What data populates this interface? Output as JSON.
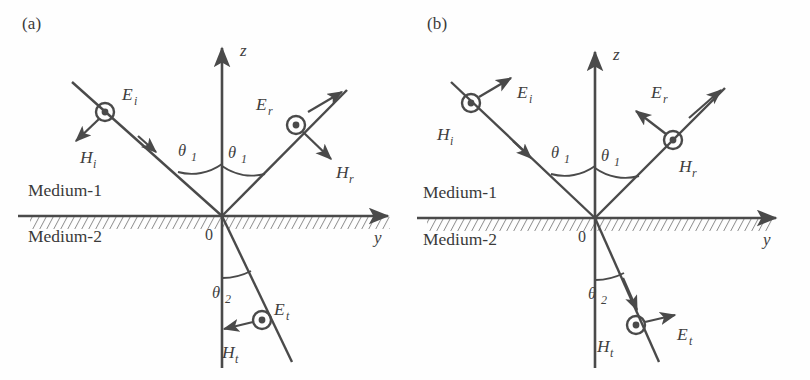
{
  "figure": {
    "type": "physics-diagram",
    "stroke_color": "#4a4a4a",
    "text_color": "#3a3a3a",
    "background": "#ffffff"
  },
  "panels": [
    {
      "id": "a",
      "label": "(a)",
      "polarization": "perpendicular",
      "origin": {
        "x": 222,
        "y": 216
      },
      "axes": {
        "z": {
          "label": "z",
          "x": 222,
          "y_top": 44,
          "y_bottom": 368
        },
        "y": {
          "label": "y",
          "x_left": 18,
          "x_right": 392,
          "y": 216
        }
      },
      "origin_label": "0",
      "media": [
        {
          "name": "Medium-1",
          "x": 28,
          "y": 190
        },
        {
          "name": "Medium-2",
          "x": 28,
          "y": 233
        }
      ],
      "angles": [
        {
          "label": "θ",
          "sub": "1",
          "x": 185,
          "y": 158,
          "arc": "incident"
        },
        {
          "label": "θ",
          "sub": "1",
          "x": 232,
          "y": 160,
          "arc": "reflected"
        },
        {
          "label": "θ",
          "sub": "2",
          "x": 215,
          "y": 292,
          "arc": "transmitted"
        }
      ],
      "rays": [
        {
          "name": "incident",
          "from": {
            "x": 72,
            "y": 82
          },
          "to": {
            "x": 222,
            "y": 216
          },
          "arrow_at": {
            "x": 150,
            "y": 147
          },
          "node": {
            "x": 105,
            "y": 112,
            "kind": "circle-dot"
          },
          "node_field": "E",
          "node_sub": "i",
          "node_label_pos": {
            "x": 122,
            "y": 104
          },
          "arrow_field": "H",
          "arrow_sub": "i",
          "arrow_from": {
            "x": 105,
            "y": 112
          },
          "arrow_to": {
            "x": 76,
            "y": 141
          },
          "arrow_label_pos": {
            "x": 82,
            "y": 166
          }
        },
        {
          "name": "reflected",
          "from": {
            "x": 222,
            "y": 216
          },
          "to": {
            "x": 345,
            "y": 92
          },
          "node": {
            "x": 296,
            "y": 125,
            "kind": "circle-dot"
          },
          "node_field": "E",
          "node_sub": "r",
          "node_label_pos": {
            "x": 258,
            "y": 110
          },
          "arrow_field": "H",
          "arrow_sub": "r",
          "arrow_from": {
            "x": 296,
            "y": 125
          },
          "arrow_to": {
            "x": 330,
            "y": 158
          },
          "arrow_label_pos": {
            "x": 336,
            "y": 178
          }
        },
        {
          "name": "transmitted",
          "from": {
            "x": 222,
            "y": 216
          },
          "to": {
            "x": 290,
            "y": 360
          },
          "node": {
            "x": 262,
            "y": 320,
            "kind": "circle-dot"
          },
          "node_field": "E",
          "node_sub": "t",
          "node_label_pos": {
            "x": 276,
            "y": 316
          },
          "arrow_field": "H",
          "arrow_sub": "t",
          "arrow_from": {
            "x": 262,
            "y": 320
          },
          "arrow_to": {
            "x": 224,
            "y": 330
          },
          "arrow_label_pos": {
            "x": 224,
            "y": 358
          }
        }
      ]
    },
    {
      "id": "b",
      "label": "(b)",
      "polarization": "parallel",
      "origin": {
        "x": 190,
        "y": 218
      },
      "axes": {
        "z": {
          "label": "z",
          "x": 190,
          "y_top": 48,
          "y_bottom": 368
        },
        "y": {
          "label": "y",
          "x_left": 12,
          "x_right": 375,
          "y": 218
        }
      },
      "origin_label": "0",
      "media": [
        {
          "name": "Medium-1",
          "x": 18,
          "y": 192
        },
        {
          "name": "Medium-2",
          "x": 18,
          "y": 236
        }
      ],
      "angles": [
        {
          "label": "θ",
          "sub": "1",
          "x": 152,
          "y": 160,
          "arc": "incident"
        },
        {
          "label": "θ",
          "sub": "1",
          "x": 200,
          "y": 163,
          "arc": "reflected"
        },
        {
          "label": "θ",
          "sub": "2",
          "x": 186,
          "y": 293,
          "arc": "transmitted"
        }
      ],
      "rays": [
        {
          "name": "incident",
          "from": {
            "x": 46,
            "y": 82
          },
          "to": {
            "x": 190,
            "y": 218
          },
          "arrow_at": {
            "x": 120,
            "y": 152
          },
          "node": {
            "x": 66,
            "y": 103,
            "kind": "circle-dot"
          },
          "node_field": "H",
          "node_sub": "i",
          "node_label_pos": {
            "x": 36,
            "y": 140
          },
          "arrow_field": "E",
          "arrow_sub": "i",
          "arrow_from": {
            "x": 66,
            "y": 103
          },
          "arrow_to": {
            "x": 104,
            "y": 80
          },
          "arrow_label_pos": {
            "x": 112,
            "y": 98
          }
        },
        {
          "name": "reflected",
          "from": {
            "x": 190,
            "y": 218
          },
          "to": {
            "x": 318,
            "y": 90
          },
          "node": {
            "x": 268,
            "y": 140,
            "kind": "circle-dot"
          },
          "node_field": "H",
          "node_sub": "r",
          "node_label_pos": {
            "x": 276,
            "y": 170
          },
          "arrow_field": "E",
          "arrow_sub": "r",
          "arrow_from": {
            "x": 268,
            "y": 140
          },
          "arrow_to": {
            "x": 232,
            "y": 112
          },
          "arrow_label_pos": {
            "x": 248,
            "y": 98
          }
        },
        {
          "name": "transmitted",
          "from": {
            "x": 190,
            "y": 218
          },
          "to": {
            "x": 252,
            "y": 360
          },
          "node": {
            "x": 231,
            "y": 325,
            "kind": "circle-dot"
          },
          "node_field": "H",
          "node_sub": "t",
          "node_label_pos": {
            "x": 196,
            "y": 352
          },
          "arrow_field": "E",
          "arrow_sub": "t",
          "arrow_from": {
            "x": 231,
            "y": 325
          },
          "arrow_to": {
            "x": 268,
            "y": 316
          },
          "arrow_label_pos": {
            "x": 272,
            "y": 340
          }
        }
      ]
    }
  ]
}
